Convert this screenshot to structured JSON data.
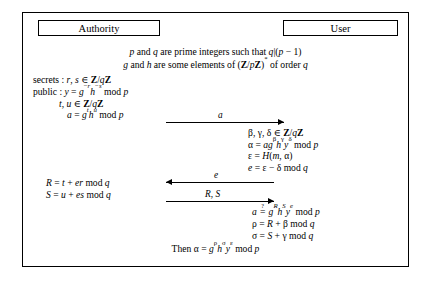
{
  "figure": {
    "parties": {
      "left": "Authority",
      "right": "User"
    },
    "common_parameters": [
      "p and q are prime integers such that q|(p − 1)",
      "g and h are some elements of (Z/pZ)* of order q"
    ],
    "authority_setup": [
      "secrets : r, s ∈ Z/qZ",
      "public : y = g−r h−s mod p",
      "t, u ∈ Z/qZ",
      "a = gt hu mod p"
    ],
    "user_block_1": [
      "β, γ, δ ∈ Z/qZ",
      "α = agβ hγ yδ mod p",
      "ε = H(m, α)",
      "e = ε − δ mod q"
    ],
    "authority_block_2": [
      "R = t + er mod q",
      "S = u + es mod q"
    ],
    "user_block_2": [
      "α ≟ gR hS ye mod p",
      "ρ = R + β mod q",
      "σ = S + γ mod q"
    ],
    "final_line": "Then α = gρ hσ yε mod p",
    "messages": [
      {
        "label": "a",
        "direction": "right"
      },
      {
        "label": "e",
        "direction": "left"
      },
      {
        "label": "R, S",
        "direction": "right"
      }
    ],
    "colors": {
      "ink": "#000000",
      "background": "#ffffff"
    }
  }
}
